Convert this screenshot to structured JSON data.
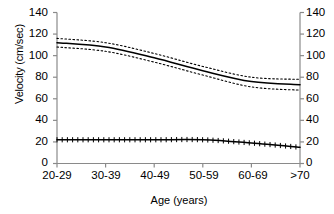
{
  "chart_data": {
    "type": "line",
    "title": "",
    "subtitle": "",
    "xlabel": "Age (years)",
    "ylabel": "Velocity (cm/sec)",
    "ylabel_right": "",
    "categories": [
      "20-29",
      "30-39",
      "40-49",
      "50-59",
      "60-69",
      ">70"
    ],
    "ylim": [
      0,
      140
    ],
    "yticks": [
      0,
      20,
      40,
      60,
      80,
      100,
      120,
      140
    ],
    "ytick_labels": [
      "0",
      "20",
      "40",
      "60",
      "80",
      "100",
      "120",
      "140"
    ],
    "yticks_right": [
      0,
      20,
      40,
      60,
      80,
      100,
      120,
      140
    ],
    "ytick_labels_right": [
      "0",
      "20",
      "40",
      "60",
      "80",
      "100",
      "120",
      "140"
    ],
    "grid": false,
    "legend": "none",
    "axes": {
      "left": true,
      "right": true,
      "bottom": true,
      "top": false
    },
    "series": [
      {
        "name": "Mean peak systolic velocity",
        "style": "solid",
        "marker": "none",
        "color": "#000000",
        "values": [
          112,
          108,
          98,
          86,
          76,
          73
        ]
      },
      {
        "name": "Upper 95% confidence limit",
        "style": "dotted",
        "marker": "none",
        "color": "#000000",
        "values": [
          116,
          112,
          102,
          90,
          80,
          78
        ]
      },
      {
        "name": "Lower 95% confidence limit",
        "style": "dotted",
        "marker": "none",
        "color": "#000000",
        "values": [
          108,
          104,
          94,
          82,
          71,
          68
        ]
      },
      {
        "name": "Mean end diastolic velocity",
        "style": "solid",
        "marker": "cross",
        "color": "#000000",
        "values": [
          22,
          22,
          22,
          22,
          19,
          15
        ]
      }
    ]
  }
}
